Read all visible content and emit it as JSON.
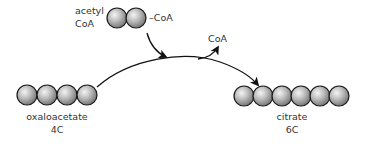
{
  "diagram": {
    "acetyl_coa": {
      "label_line1": "acetyl",
      "label_line2": "CoA",
      "attached_group": "–CoA",
      "carbons": 2
    },
    "released": {
      "label": "CoA"
    },
    "oxaloacetate": {
      "name": "oxaloacetate",
      "carbon_label": "4C",
      "carbons": 4
    },
    "citrate": {
      "name": "citrate",
      "carbon_label": "6C",
      "carbons": 6
    },
    "colors": {
      "ball_fill_light": "#e8e8e8",
      "ball_fill_dark": "#7a7a7a",
      "ball_stroke": "#1a1a1a",
      "arrow": "#111111",
      "text": "#333333"
    }
  }
}
